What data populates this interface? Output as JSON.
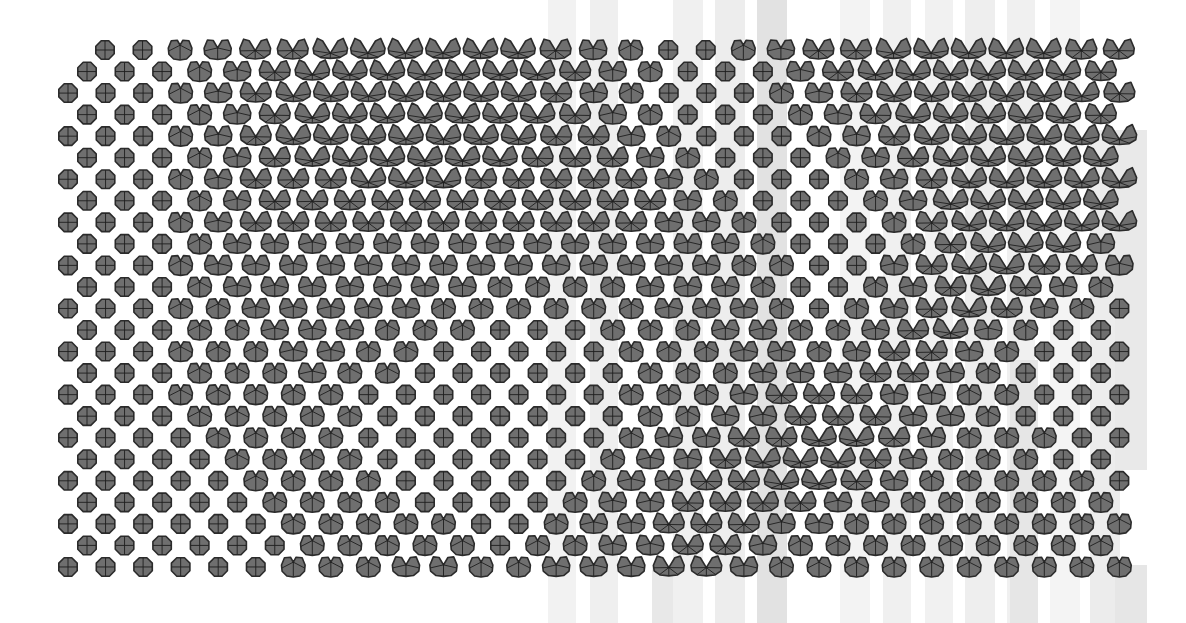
{
  "canvas": {
    "width": 1186,
    "height": 623,
    "background": "#ffffff"
  },
  "style": {
    "fill": "#6f6f6f",
    "stroke": "#2b2b2b",
    "inner_stroke": "#1e1e1e"
  },
  "grid": {
    "dx": 37.55,
    "dy": 21.54,
    "y0": 50,
    "first_row_x0": 105,
    "odd_row_x0": 87,
    "even_row_x0": 68,
    "radius": 10,
    "levels_legend": [
      "closed-octagon",
      "small-notch",
      "v-notch",
      "bowtie",
      "wide-bowtie"
    ],
    "rows": [
      "0012334444443210012334444433",
      "0001234444444321000234444443",
      "00012344444443210001234444443",
      "0001234444444321000123444443",
      "00012344444443321000123444444",
      "0001234444443332100012344444",
      "00012333444333332100012344444",
      "0001233333333333210001244444",
      "00012333333333332210001344444",
      "0001222222222222221000134442",
      "00012222222222222211002344332",
      "0001222222211112221001234321",
      "00011222221111112221012343210",
      "0001122211100011122112342100",
      "00011122110000011122123321000",
      "0001112110000001112223321000",
      "00011111000000011123332211000",
      "0001111100000001122333221000",
      "00001111000000012233443211100",
      "0000111100000012234443211100",
      "00000111100000122334432111110",
      "0000011110000122333322111111",
      "00000011111001223332211111111",
      "0000001111101122332111111111",
      "00000011122112223321111111111"
    ]
  },
  "bands": [
    {
      "x": 548,
      "y": 0,
      "w": 28,
      "h": 623,
      "color": "#f2f2f2"
    },
    {
      "x": 590,
      "y": 0,
      "w": 28,
      "h": 623,
      "color": "#efefef"
    },
    {
      "x": 652,
      "y": 565,
      "w": 30,
      "h": 58,
      "color": "#e8e8e8"
    },
    {
      "x": 673,
      "y": 0,
      "w": 30,
      "h": 623,
      "color": "#f0f0f0"
    },
    {
      "x": 715,
      "y": 0,
      "w": 30,
      "h": 623,
      "color": "#ededed"
    },
    {
      "x": 757,
      "y": 0,
      "w": 30,
      "h": 623,
      "color": "#e2e2e2"
    },
    {
      "x": 840,
      "y": 0,
      "w": 30,
      "h": 623,
      "color": "#f3f3f3"
    },
    {
      "x": 883,
      "y": 0,
      "w": 28,
      "h": 623,
      "color": "#f0f0f0"
    },
    {
      "x": 925,
      "y": 0,
      "w": 28,
      "h": 623,
      "color": "#f1f1f1"
    },
    {
      "x": 965,
      "y": 0,
      "w": 30,
      "h": 623,
      "color": "#eeeeee"
    },
    {
      "x": 1007,
      "y": 0,
      "w": 28,
      "h": 623,
      "color": "#f0f0f0"
    },
    {
      "x": 1010,
      "y": 360,
      "w": 28,
      "h": 263,
      "color": "#e6e6e6"
    },
    {
      "x": 1050,
      "y": 0,
      "w": 30,
      "h": 623,
      "color": "#f4f4f4"
    },
    {
      "x": 1090,
      "y": 130,
      "w": 30,
      "h": 493,
      "color": "#ececec"
    },
    {
      "x": 1115,
      "y": 130,
      "w": 32,
      "h": 340,
      "color": "#e9e9e9"
    },
    {
      "x": 1115,
      "y": 565,
      "w": 32,
      "h": 58,
      "color": "#e6e6e6"
    }
  ]
}
